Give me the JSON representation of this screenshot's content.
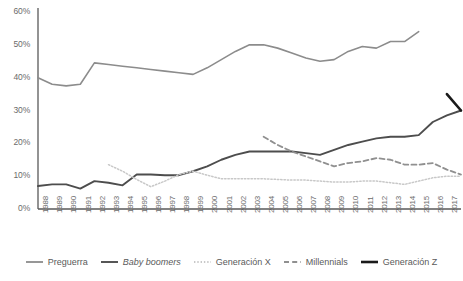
{
  "chart_data": {
    "type": "line",
    "title": "",
    "xlabel": "",
    "ylabel": "",
    "ylim": [
      0,
      60
    ],
    "ytick_labels": [
      "0%",
      "10%",
      "20%",
      "30%",
      "40%",
      "50%",
      "60%"
    ],
    "ytick_values": [
      0,
      10,
      20,
      30,
      40,
      50,
      60
    ],
    "grid": false,
    "legend_position": "bottom",
    "x": [
      1988,
      1989,
      1990,
      1991,
      1992,
      1993,
      1994,
      1995,
      1996,
      1997,
      1998,
      1999,
      2000,
      2001,
      2002,
      2003,
      2004,
      2005,
      2006,
      2007,
      2008,
      2009,
      2010,
      2011,
      2012,
      2013,
      2014,
      2015,
      2016,
      2017,
      2018
    ],
    "categories": [
      "1988",
      "1989",
      "1990",
      "1991",
      "1992",
      "1993",
      "1994",
      "1995",
      "1996",
      "1997",
      "1998",
      "1999",
      "2000",
      "2001",
      "2002",
      "2003",
      "2004",
      "2005",
      "2006",
      "2007",
      "2008",
      "2009",
      "2010",
      "2011",
      "2012",
      "2013",
      "2014",
      "2015",
      "2016",
      "2017",
      "2018"
    ],
    "series": [
      {
        "name": "Preguerra",
        "color": "#8c8c8c",
        "style": "solid",
        "width": 1.6,
        "values": [
          40,
          38,
          37.5,
          38,
          44.5,
          44,
          43.5,
          43,
          42.5,
          42,
          41.5,
          41,
          43,
          45.5,
          48,
          50,
          50,
          49,
          47.5,
          46,
          45,
          45.5,
          48,
          49.5,
          49,
          51,
          51,
          54,
          null,
          null,
          null
        ]
      },
      {
        "name": "Baby boomers",
        "color": "#4d4d4d",
        "style": "solid",
        "width": 1.9,
        "italic_label": true,
        "values": [
          7,
          7.5,
          7.5,
          6.2,
          8.5,
          8,
          7.2,
          10.5,
          10.5,
          10.3,
          10.3,
          11.5,
          13,
          15,
          16.5,
          17.5,
          17.5,
          17.5,
          17.5,
          17,
          16.5,
          18,
          19.5,
          20.5,
          21.5,
          22,
          22,
          22.5,
          26.5,
          28.5,
          30
        ]
      },
      {
        "name": "Generación X",
        "color": "#c8c8c8",
        "style": "dotted",
        "width": 1.5,
        "values": [
          null,
          null,
          null,
          null,
          null,
          13.5,
          11.5,
          9,
          6.8,
          8.5,
          10.5,
          11.5,
          10.3,
          9.2,
          9.2,
          9.2,
          9.2,
          9,
          8.8,
          8.8,
          8.5,
          8.2,
          8.2,
          8.5,
          8.5,
          8,
          7.5,
          8.5,
          9.5,
          10,
          10
        ]
      },
      {
        "name": "Millennials",
        "color": "#909090",
        "style": "dashed",
        "width": 1.8,
        "values": [
          null,
          null,
          null,
          null,
          null,
          null,
          null,
          null,
          null,
          null,
          null,
          null,
          null,
          null,
          null,
          null,
          22,
          19.5,
          17.5,
          16,
          14.5,
          13,
          14,
          14.5,
          15.5,
          15,
          13.5,
          13.5,
          14,
          12,
          10.5
        ]
      },
      {
        "name": "Generación Z",
        "color": "#1a1a1a",
        "style": "solid",
        "width": 2.6,
        "values": [
          null,
          null,
          null,
          null,
          null,
          null,
          null,
          null,
          null,
          null,
          null,
          null,
          null,
          null,
          null,
          null,
          null,
          null,
          null,
          null,
          null,
          null,
          null,
          null,
          null,
          null,
          null,
          null,
          null,
          35,
          30
        ]
      }
    ]
  },
  "legend": {
    "items": [
      {
        "label": "Preguerra"
      },
      {
        "label": "Baby boomers"
      },
      {
        "label": "Generación X"
      },
      {
        "label": "Millennials"
      },
      {
        "label": "Generación Z"
      }
    ]
  },
  "axes": {
    "axis_color": "#595959"
  }
}
